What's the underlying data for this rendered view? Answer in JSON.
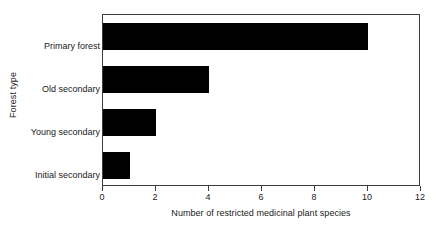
{
  "chart_data": {
    "type": "bar",
    "orientation": "horizontal",
    "title": "",
    "xlabel": "Number of restricted medicinal plant species",
    "ylabel": "Forest type",
    "categories": [
      "Primary forest",
      "Old secondary",
      "Young secondary",
      "Initial secondary"
    ],
    "values": [
      10,
      4,
      2,
      1
    ],
    "series": [
      {
        "name": "Number of restricted medicinal plant species",
        "values": [
          10,
          4,
          2,
          1
        ]
      }
    ],
    "xlim": [
      0,
      12
    ],
    "xticks": [
      0,
      2,
      4,
      6,
      8,
      10,
      12
    ],
    "xtick_labels": [
      "0",
      "2",
      "4",
      "6",
      "8",
      "10",
      "12"
    ],
    "yticks": [
      "Primary forest",
      "Old secondary",
      "Young secondary",
      "Initial secondary"
    ],
    "grid": false,
    "legend": false,
    "legend_position": "none",
    "bar_color": "#000000",
    "axis_color": "#3d3d3d",
    "background_color": "#ffffff",
    "text_color": "#1a1a1a",
    "annotations": []
  }
}
